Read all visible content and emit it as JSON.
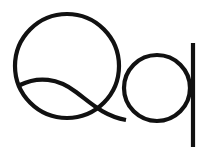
{
  "specimen": {
    "glyphs": "Qq",
    "uppercase": "Q",
    "lowercase": "q",
    "ink_color": "#111111",
    "background_color": "#ffffff"
  }
}
